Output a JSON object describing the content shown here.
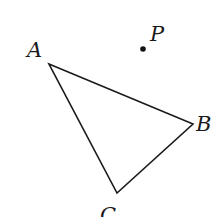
{
  "diagram": {
    "type": "geometry-triangle-with-point",
    "stroke_color": "#1a1a1a",
    "background": "#ffffff",
    "triangle": {
      "vertices": [
        {
          "name": "A",
          "x": 49,
          "y": 64
        },
        {
          "name": "B",
          "x": 193,
          "y": 124
        },
        {
          "name": "C",
          "x": 117,
          "y": 193
        }
      ]
    },
    "point": {
      "name": "P",
      "x": 143,
      "y": 49
    },
    "labels": {
      "A": "A",
      "B": "B",
      "C": "C",
      "P": "P"
    }
  }
}
